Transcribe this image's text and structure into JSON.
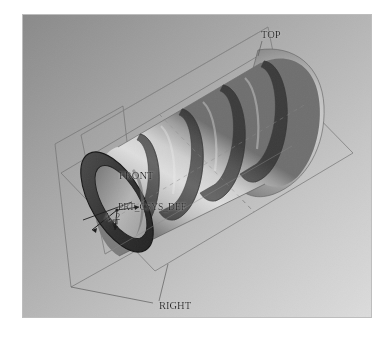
{
  "app": {
    "kind": "cad-3d-model-view",
    "model_description": "Shaded isometric 3D solid model of a hollow cylindrical tube with four circumferential grooves, open bore at the near-left end and a rounded closed dome at the far-right end"
  },
  "viewport": {
    "background_top_left_color": "#8b8b8b",
    "background_bottom_right_color": "#d6d6d6",
    "border_color": "#b8b8b8",
    "canvas_color": "#ffffff"
  },
  "model": {
    "name": "grooved-cylinder",
    "surface_light_color": "#d4d4d4",
    "surface_mid_color": "#b5b5b5",
    "surface_shadow_color": "#8c8c8c",
    "groove_color": "#5c5c5c",
    "groove_dark_color": "#4a4a4a",
    "end_face_color": "#3f3f3f",
    "bore_color": "#a9a9a9",
    "edge_color": "#2a2a2a",
    "groove_count": 4,
    "open_end": "lower-left",
    "closed_end": "upper-right"
  },
  "datum_planes": {
    "line_color": "#6c6c6c",
    "dashed_color": "#7a7a7a",
    "items": [
      {
        "id": "top",
        "label": "TOP"
      },
      {
        "id": "front",
        "label": "FRONT"
      },
      {
        "id": "right",
        "label": "RIGHT"
      }
    ]
  },
  "coordinate_system": {
    "label": "PRT_CSYS_DEF",
    "marker": "x-marker",
    "color": "#1b1b1b"
  },
  "axis": {
    "label": "A_2",
    "color": "#1b1b1b"
  },
  "labels": {
    "top": "TOP",
    "front": "FRONT",
    "right": "RIGHT",
    "csys": "PRT_CSYS_DEF",
    "axis": "A_2"
  }
}
